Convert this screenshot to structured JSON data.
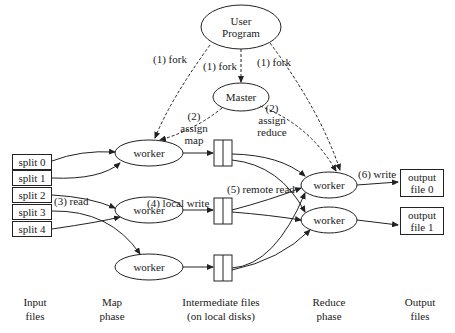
{
  "diagram": {
    "nodes": {
      "user_program": "User\nProgram",
      "user_program_line1": "User",
      "user_program_line2": "Program",
      "master": "Master",
      "map_workers": [
        "worker",
        "worker",
        "worker"
      ],
      "reduce_workers": [
        "worker",
        "worker"
      ]
    },
    "input_splits": [
      "split 0",
      "split 1",
      "split 2",
      "split 3",
      "split 4"
    ],
    "output_files": [
      {
        "line1": "output",
        "line2": "file 0"
      },
      {
        "line1": "output",
        "line2": "file 1"
      }
    ],
    "edge_labels": {
      "fork_left": "(1) fork",
      "fork_center": "(1) fork",
      "fork_right": "(1) fork",
      "assign_map_num": "(2)",
      "assign_map_1": "assign",
      "assign_map_2": "map",
      "assign_reduce_num": "(2)",
      "assign_reduce_1": "assign",
      "assign_reduce_2": "reduce",
      "read": "(3) read",
      "local_write": "(4) local write",
      "remote_read": "(5) remote read",
      "write": "(6) write"
    },
    "phases": [
      {
        "line1": "Input",
        "line2": "files"
      },
      {
        "line1": "Map",
        "line2": "phase"
      },
      {
        "line1": "Intermediate files",
        "line2": "(on local disks)"
      },
      {
        "line1": "Reduce",
        "line2": "phase"
      },
      {
        "line1": "Output",
        "line2": "files"
      }
    ]
  }
}
